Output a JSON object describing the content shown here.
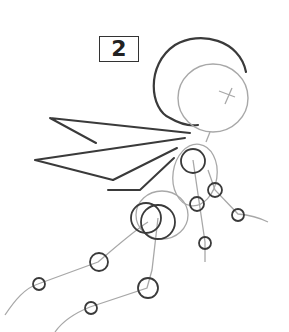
{
  "step": {
    "number": "2"
  },
  "colors": {
    "dark_stroke": "#3a3a3a",
    "light_stroke": "#a8a8a8",
    "background": "#ffffff"
  }
}
